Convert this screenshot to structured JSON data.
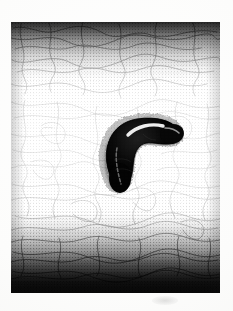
{
  "image": {
    "kind": "scanned-halftone-photograph",
    "title": "Dark curved larva on fibrous substrate",
    "medium": "black and white halftone print, scanned",
    "orientation": "portrait",
    "caption": "",
    "canvas": {
      "width_px": 233,
      "height_px": 311,
      "background_color": "#ffffff"
    },
    "plate": {
      "label": "photographic plate",
      "left_px": 11,
      "top_px": 22,
      "width_px": 209,
      "height_px": 271,
      "border": "none",
      "ink_color": "#111111",
      "paper_color": "#fbfbfa"
    },
    "tonal_bands": [
      {
        "name": "top-vignette",
        "position": "top",
        "height_pct": 23,
        "description": "heavy dark grain band fading downward"
      },
      {
        "name": "mid-field",
        "position": "middle",
        "height_pct": 50,
        "description": "light field with dotted halftone and thin dark fibres"
      },
      {
        "name": "bottom-vignette",
        "position": "bottom",
        "height_pct": 31,
        "description": "dense black band, solid at the very bottom"
      }
    ],
    "texture": {
      "name": "fibrous-substrate",
      "description": "dense mat of fine curved threads over stippled halftone dots",
      "dot_color": "#1a1a1a",
      "fibre_color": "#2b2b2b",
      "fibre_count": 96
    },
    "subject": {
      "name": "larva",
      "common_description": "dark curved worm-like larva, hook or J shaped",
      "color": "#0c0c0c",
      "highlight_color": "#f2f2f0",
      "bounding_box_px": {
        "x": 90,
        "y": 114,
        "width": 86,
        "height": 76
      },
      "pose": "body curls from a blunt rounded tail at lower left, arcs up and to the right, ending in a rounded head at the right",
      "features": [
        {
          "name": "head",
          "description": "rounded blunt anterior end at upper right"
        },
        {
          "name": "tail",
          "description": "rounded blunt posterior end at lower left"
        },
        {
          "name": "dorsal-highlight",
          "description": "bright specular streak along the upper back"
        },
        {
          "name": "lateral-stripe",
          "description": "pale segmented line running along the lower body"
        },
        {
          "name": "setae-halo",
          "description": "fine bristly fringe of dots around the body outline"
        }
      ]
    },
    "marks": [
      {
        "name": "sheet-smudge",
        "description": "faint grey smudge on the paper below the plate",
        "x_px": 152,
        "y_px": 296
      }
    ]
  }
}
